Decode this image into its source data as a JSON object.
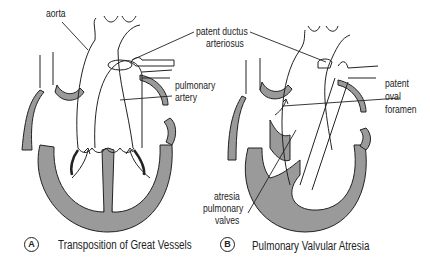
{
  "colors": {
    "tissue_fill": "#9a9a9a",
    "line": "#222222",
    "background": "#ffffff"
  },
  "panel_a": {
    "badge": "A",
    "caption": "Transposition of Great Vessels",
    "labels": {
      "aorta": "aorta",
      "pda_line1": "patent ductus",
      "pda_line2": "arteriosus",
      "pa_line1": "pulmonary",
      "pa_line2": "artery"
    }
  },
  "panel_b": {
    "badge": "B",
    "caption": "Pulmonary Valvular Atresia",
    "labels": {
      "pfo_line1": "patent",
      "pfo_line2": "oval",
      "pfo_line3": "foramen",
      "atr_line1": "atresia",
      "atr_line2": "pulmonary",
      "atr_line3": "valves"
    }
  }
}
